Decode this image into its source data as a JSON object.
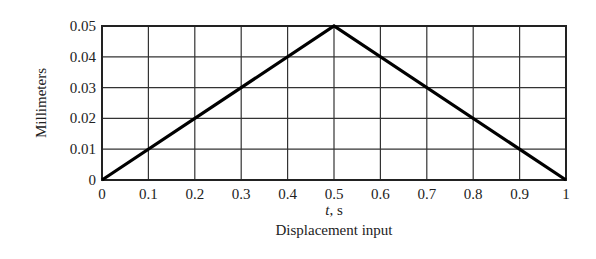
{
  "chart_data": {
    "type": "line",
    "title": "Displacement input",
    "xlabel": "t, s",
    "xlabel_italic_part": "t",
    "xlabel_rest": ", s",
    "ylabel": "Millimeters",
    "xlim": [
      0,
      1
    ],
    "ylim": [
      0,
      0.05
    ],
    "grid": true,
    "x_ticks": [
      "0",
      "0.1",
      "0.2",
      "0.3",
      "0.4",
      "0.5",
      "0.6",
      "0.7",
      "0.8",
      "0.9",
      "1"
    ],
    "y_ticks": [
      "0",
      "0.01",
      "0.02",
      "0.03",
      "0.04",
      "0.05"
    ],
    "series": [
      {
        "name": "Displacement",
        "x": [
          0,
          0.5,
          1
        ],
        "y": [
          0,
          0.05,
          0
        ],
        "color": "#000000"
      }
    ]
  }
}
